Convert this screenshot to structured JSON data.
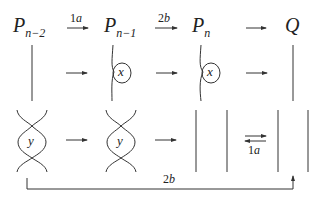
{
  "nodes": {
    "p_n_minus_2": {
      "base": "P",
      "sub": "n−2"
    },
    "p_n_minus_1": {
      "base": "P",
      "sub": "n−1"
    },
    "p_n": {
      "base": "P",
      "sub": "n"
    },
    "q": {
      "base": "Q"
    }
  },
  "arrows": {
    "top_1": {
      "label_num": "1",
      "label_var": "a"
    },
    "top_2": {
      "label_num": "2",
      "label_var": "b"
    },
    "bottom_long": {
      "label_num": "2",
      "label_var": "b"
    },
    "bottom_double": {
      "label_num": "1",
      "label_var": "a"
    }
  },
  "tangles": {
    "x_left": "x",
    "x_right": "x",
    "y_left": "y",
    "y_right": "y"
  },
  "colors": {
    "stroke": "#333333",
    "background": "#ffffff"
  }
}
